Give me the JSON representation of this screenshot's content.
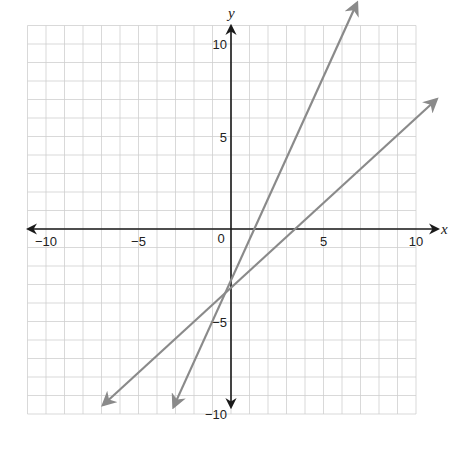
{
  "chart_data": {
    "type": "line",
    "title": "",
    "xlabel": "x",
    "ylabel": "y",
    "xlim": [
      -11,
      10
    ],
    "ylim": [
      -10,
      11
    ],
    "grid": true,
    "grid_step": 1,
    "x_tick_labels": [
      {
        "value": -10,
        "label": "−10"
      },
      {
        "value": -5,
        "label": "−5"
      },
      {
        "value": 0,
        "label": "0"
      },
      {
        "value": 5,
        "label": "5"
      },
      {
        "value": 10,
        "label": "10"
      }
    ],
    "y_tick_labels": [
      {
        "value": 10,
        "label": "10"
      },
      {
        "value": 5,
        "label": "5"
      },
      {
        "value": -5,
        "label": "−5"
      },
      {
        "value": -10,
        "label": "−10"
      }
    ],
    "series": [
      {
        "name": "line-steep",
        "equation_estimate": "y = 2x - 4",
        "y_intercept": -4,
        "x_intercept_observed": 1.8,
        "endpoints": [
          [
            -3.1,
            -9.6
          ],
          [
            6.8,
            12.2
          ]
        ],
        "arrows_both_ends": true,
        "color": "#8a8a8a"
      },
      {
        "name": "line-shallow",
        "equation_estimate": "y = x - 4",
        "y_intercept": -4,
        "x_intercept_observed": 4.0,
        "endpoints": [
          [
            -6.9,
            -9.5
          ],
          [
            11.1,
            7.0
          ]
        ],
        "arrows_both_ends": true,
        "color": "#8a8a8a"
      }
    ],
    "intersection": [
      0,
      -4
    ],
    "legend": null
  },
  "colors": {
    "grid": "#cfcfcf",
    "axis": "#1a1a1a",
    "lines": "#8a8a8a",
    "background": "#ffffff"
  }
}
